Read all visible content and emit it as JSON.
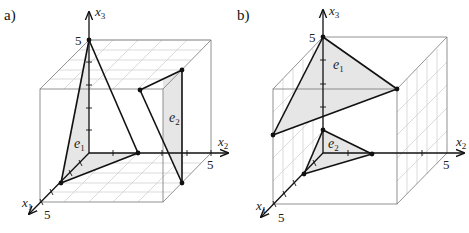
{
  "panels": [
    {
      "id": "a",
      "label": "a)",
      "axes": {
        "x1": {
          "name": "x",
          "sub": "1",
          "tick_label": "5"
        },
        "x2": {
          "name": "x",
          "sub": "2",
          "tick_label": "5"
        },
        "x3": {
          "name": "x",
          "sub": "3",
          "tick_label": "5"
        }
      },
      "planes": [
        {
          "name": "e",
          "sub": "1"
        },
        {
          "name": "e",
          "sub": "2"
        }
      ]
    },
    {
      "id": "b",
      "label": "b)",
      "axes": {
        "x1": {
          "name": "x",
          "sub": "1",
          "tick_label": "5"
        },
        "x2": {
          "name": "x",
          "sub": "2",
          "tick_label": "5"
        },
        "x3": {
          "name": "x",
          "sub": "3",
          "tick_label": "5"
        }
      },
      "planes": [
        {
          "name": "e",
          "sub": "1"
        },
        {
          "name": "e",
          "sub": "2"
        }
      ]
    }
  ],
  "colors": {
    "shade": "#e6e6e6",
    "line": "#111111",
    "grid": "#cccccc"
  }
}
